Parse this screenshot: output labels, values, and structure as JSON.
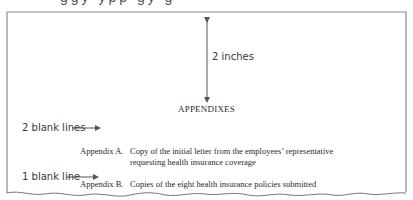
{
  "figure": {
    "cropped_top_text": "ggy ypp gy g",
    "dimension_label": "2 inches",
    "heading": "APPENDIXES",
    "annotations": {
      "two_blank_lines": "2 blank lines",
      "one_blank_line": "1 blank line"
    },
    "appendices": [
      {
        "label": "Appendix A.",
        "lines": [
          "Copy of the initial letter from the employees’ representative",
          "requesting health insurance coverage"
        ]
      },
      {
        "label": "Appendix B.",
        "lines": [
          "Copies of the eight health insurance policies submitted"
        ]
      }
    ]
  }
}
